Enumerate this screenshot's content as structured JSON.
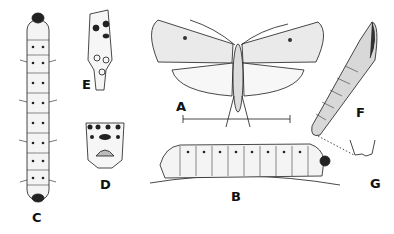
{
  "figure": {
    "labels": {
      "A": "A",
      "B": "B",
      "C": "C",
      "D": "D",
      "E": "E",
      "F": "F",
      "G": "G"
    },
    "parts": [
      {
        "label": "A",
        "depicts": "adult moth, wings spread, with scale bar"
      },
      {
        "label": "B",
        "depicts": "larva, lateral view on stem"
      },
      {
        "label": "C",
        "depicts": "larva, dorsal view"
      },
      {
        "label": "D",
        "depicts": "larval posterior segment detail"
      },
      {
        "label": "E",
        "depicts": "larval segment, lateral detail"
      },
      {
        "label": "F",
        "depicts": "pupa"
      },
      {
        "label": "G",
        "depicts": "cremaster detail of pupa"
      }
    ],
    "colors": {
      "ink": "#1a1a1a",
      "background": "#ffffff"
    }
  }
}
